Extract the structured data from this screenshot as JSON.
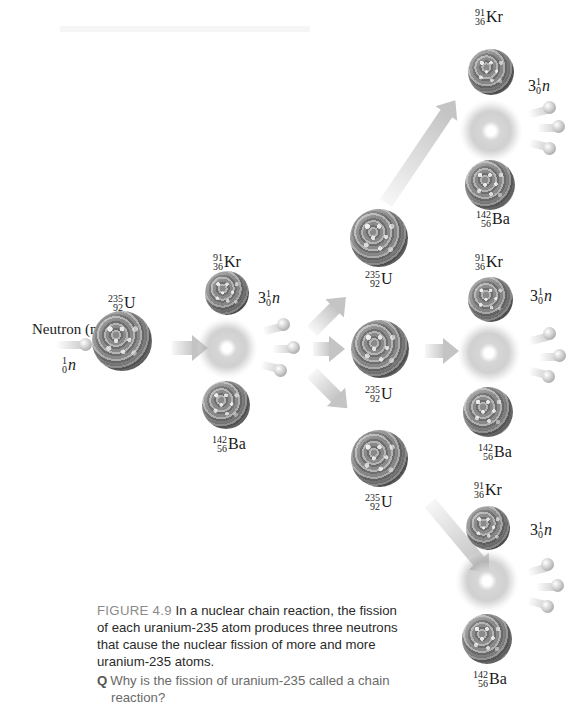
{
  "figure": {
    "neutron_label": "Neutron (n)",
    "initial_neutron": {
      "mass": "1",
      "atomic": "0",
      "symbol": "n"
    },
    "uranium": {
      "mass": "235",
      "atomic": "92",
      "symbol": "U"
    },
    "krypton": {
      "mass": "91",
      "atomic": "36",
      "symbol": "Kr"
    },
    "barium": {
      "mass": "142",
      "atomic": "56",
      "symbol": "Ba"
    },
    "neutrons_released": {
      "coef": "3",
      "mass": "1",
      "atomic": "0",
      "symbol": "n"
    },
    "colors": {
      "nucleus": "#8a8a8a",
      "arrow": "#c4c4c4",
      "caption_label": "#8a8a8a"
    }
  },
  "caption": {
    "figure_label": "FIGURE 4.9",
    "text": "In a nuclear chain reaction, the fission of each uranium-235 atom produces three neutrons that cause the nuclear fission of more and more uranium-235 atoms.",
    "question_marker": "Q",
    "question": "Why is the fission of uranium-235 called a chain reaction?"
  }
}
